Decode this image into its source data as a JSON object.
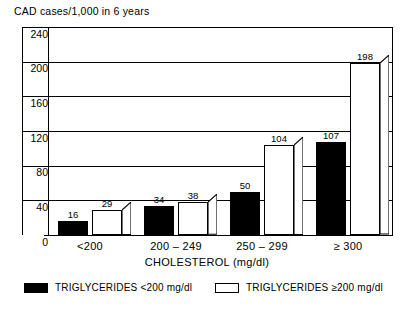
{
  "chart_data": {
    "type": "bar",
    "title": "CAD cases/1,000 in 6 years",
    "xlabel": "CHOLESTEROL  (mg/dl)",
    "ylabel": "CAD cases/1,000 in 6 years",
    "categories": [
      "<200",
      "200 – 249",
      "250 – 299",
      "≥ 300"
    ],
    "series": [
      {
        "name": "TRIGLYCERIDES  <200 mg/dl",
        "color": "#000000",
        "fill": "black",
        "values": [
          16,
          34,
          50,
          107
        ]
      },
      {
        "name": "TRIGLYCERIDES  ≥200 mg/dl",
        "color": "#ffffff",
        "fill": "white",
        "values": [
          29,
          38,
          104,
          198
        ]
      }
    ],
    "ylim": [
      0,
      240
    ],
    "yticks": [
      0,
      40,
      80,
      120,
      160,
      200,
      240
    ],
    "ytick_labels": [
      "0",
      "40",
      "80",
      "120",
      "160",
      "200",
      "240"
    ],
    "grid": true,
    "grid_axis": "y",
    "legend_position": "bottom",
    "data_labels": [
      {
        "category": "<200",
        "series": "TRIGLYCERIDES  <200 mg/dl",
        "value": "16"
      },
      {
        "category": "<200",
        "series": "TRIGLYCERIDES  ≥200 mg/dl",
        "value": "29"
      },
      {
        "category": "200 – 249",
        "series": "TRIGLYCERIDES  <200 mg/dl",
        "value": "34"
      },
      {
        "category": "200 – 249",
        "series": "TRIGLYCERIDES  ≥200 mg/dl",
        "value": "38"
      },
      {
        "category": "250 – 299",
        "series": "TRIGLYCERIDES  <200 mg/dl",
        "value": "50"
      },
      {
        "category": "250 – 299",
        "series": "TRIGLYCERIDES  ≥200 mg/dl",
        "value": "104"
      },
      {
        "category": "≥ 300",
        "series": "TRIGLYCERIDES  <200 mg/dl",
        "value": "107"
      },
      {
        "category": "≥ 300",
        "series": "TRIGLYCERIDES  ≥200 mg/dl",
        "value": "198"
      }
    ]
  },
  "legend": {
    "items": [
      {
        "label": "TRIGLYCERIDES  <200 mg/dl",
        "fill": "black"
      },
      {
        "label": "TRIGLYCERIDES  ≥200 mg/dl",
        "fill": "white"
      }
    ]
  }
}
